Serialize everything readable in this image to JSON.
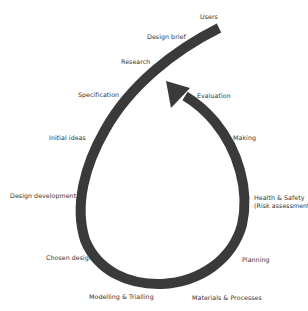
{
  "diagram": {
    "type": "design-process-loop",
    "stroke_color": "#3a3a3a",
    "background": "#ffffff",
    "stages": [
      {
        "label": "Users",
        "x": 200,
        "y": 13
      },
      {
        "label": "Design brief",
        "x": 147,
        "y": 33
      },
      {
        "label": "Research",
        "x": 121,
        "y": 58
      },
      {
        "label": "Specification",
        "x": 78,
        "y": 91
      },
      {
        "label": "Evaluation",
        "x": 197,
        "y": 92
      },
      {
        "label": "Initial ideas",
        "x": 49,
        "y": 134
      },
      {
        "label": "Making",
        "x": 233,
        "y": 134
      },
      {
        "label": "Design development",
        "x": 10,
        "y": 192
      },
      {
        "label": "Health & Safety",
        "x": 254,
        "y": 194
      },
      {
        "label": "(Risk assessment)",
        "x": 254,
        "y": 202
      },
      {
        "label": "Chosen design",
        "x": 46,
        "y": 254
      },
      {
        "label": "Planning",
        "x": 242,
        "y": 256
      },
      {
        "label": "Modelling & Trialling",
        "x": 89,
        "y": 293
      },
      {
        "label": "Materials & Processes",
        "x": 192,
        "y": 294
      }
    ]
  }
}
